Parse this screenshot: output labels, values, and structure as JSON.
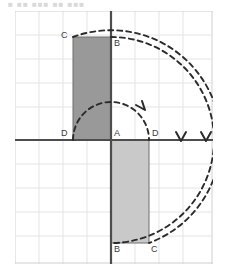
{
  "caption": {
    "text": "■  ■■ ■■■  ■■ ■■■"
  },
  "figure": {
    "colors": {
      "grid_line": "#e2e2e2",
      "grid_frame": "#cfcfcf",
      "axis": "#4d4d4d",
      "rect_upper_fill": "#999999",
      "rect_lower_fill": "#c9c9c9",
      "rect_stroke": "#6e6e6e",
      "arc_dash": "#2b2b2b",
      "label_text": "#3a3a3a",
      "background": "#ffffff"
    },
    "grid": {
      "cell_size_px": 24,
      "columns": 8,
      "rows": 10,
      "visible": true
    },
    "axes": {
      "origin_label": "A",
      "x_axis_visible": true,
      "y_axis_visible": true
    },
    "shapes": [
      {
        "name": "rectangle-preimage",
        "position": "upper-left",
        "fill": "#999999",
        "vertices": [
          {
            "label": "D",
            "x": 73,
            "y": 140
          },
          {
            "label": "C",
            "x": 73,
            "y": 37
          },
          {
            "label": "B",
            "x": 111,
            "y": 37
          },
          {
            "label": "A",
            "x": 111,
            "y": 140
          }
        ]
      },
      {
        "name": "rectangle-image",
        "position": "lower-right",
        "fill": "#c9c9c9",
        "vertices": [
          {
            "label": "A",
            "x": 111,
            "y": 140
          },
          {
            "label": "B",
            "x": 111,
            "y": 243
          },
          {
            "label": "C",
            "x": 149,
            "y": 243
          },
          {
            "label": "D",
            "x": 149,
            "y": 140
          }
        ]
      }
    ],
    "labels": [
      {
        "name": "label-C-upper",
        "text": "C",
        "x": 63,
        "y": 32
      },
      {
        "name": "label-B-upper",
        "text": "B",
        "x": 114,
        "y": 40
      },
      {
        "name": "label-D-left",
        "text": "D",
        "x": 62,
        "y": 130
      },
      {
        "name": "label-A-origin",
        "text": "A",
        "x": 114,
        "y": 130
      },
      {
        "name": "label-D-right",
        "text": "D",
        "x": 152,
        "y": 130
      },
      {
        "name": "label-B-lower",
        "text": "B",
        "x": 114,
        "y": 246
      },
      {
        "name": "label-C-lower",
        "text": "C",
        "x": 151,
        "y": 246
      }
    ],
    "arcs": [
      {
        "name": "arc-D-rotation",
        "radius_px": 38,
        "arrow_at": "x=149,y=140"
      },
      {
        "name": "arc-C-rotation",
        "radius_px": 70,
        "arrow_at": "x=181,y=140"
      },
      {
        "name": "arc-B-rotation",
        "radius_px": 95,
        "arrow_at": "x=206,y=140"
      }
    ]
  }
}
